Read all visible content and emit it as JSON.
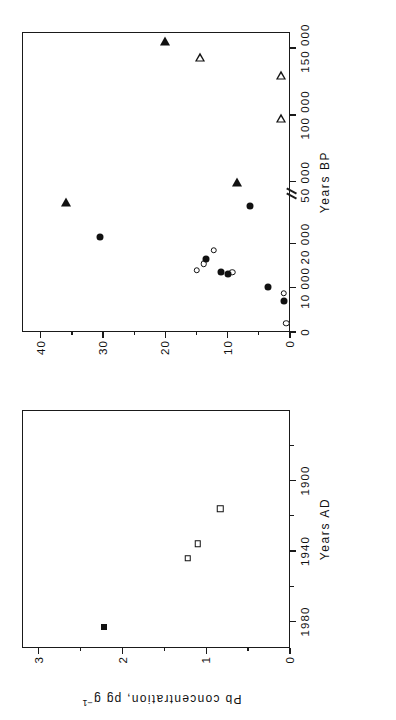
{
  "figure": {
    "y_axis_label": "Pb concentration, pg g",
    "y_axis_label_exp": "−1",
    "background": "#ffffff",
    "foreground": "#111111"
  },
  "panels": [
    {
      "id": "left",
      "x_axis_title": "Years AD",
      "x_ticks": [
        "1980",
        "1940",
        "1900"
      ],
      "x_tick_values": [
        1980,
        1940,
        1900
      ],
      "x_min": 1995,
      "x_max": 1860,
      "y_ticks": [
        "0",
        "1",
        "2",
        "3"
      ],
      "y_tick_values": [
        0,
        1,
        2,
        3
      ],
      "y_min": 0,
      "y_max": 3.2
    },
    {
      "id": "right",
      "x_axis_title": "Years BP",
      "x_ticks": [
        "0",
        "10 000",
        "20 000",
        "50 000",
        "100 000",
        "150 000"
      ],
      "x_tick_values": [
        0,
        10000,
        20000,
        50000,
        100000,
        150000
      ],
      "y_ticks": [
        "0",
        "10",
        "20",
        "30",
        "40"
      ],
      "y_tick_values": [
        0,
        10,
        20,
        30,
        40
      ],
      "y_min": 0,
      "y_max": 43,
      "axis_break": true,
      "axis_break_after": 30000
    }
  ],
  "chart_data": {
    "type": "scatter",
    "title": "",
    "xlabel": "Years AD / Years BP",
    "ylabel": "Pb concentration, pg g−1",
    "grid": false,
    "legend": "none",
    "panels": [
      {
        "name": "left",
        "xlabel": "Years AD",
        "ylabel": "Pb concentration, pg g−1",
        "xlim": [
          1995,
          1860
        ],
        "ylim": [
          0,
          3.2
        ],
        "xticks": [
          1980,
          1940,
          1900
        ],
        "yticks": [
          0,
          1,
          2,
          3
        ],
        "series": [
          {
            "name": "modern-snow-filled-square",
            "marker": "square-filled",
            "points": [
              {
                "x": 1983,
                "y": 2.22
              }
            ]
          },
          {
            "name": "historic-ice-open-square",
            "marker": "square-open",
            "points": [
              {
                "x": 1944,
                "y": 1.22
              },
              {
                "x": 1936,
                "y": 1.1
              },
              {
                "x": 1916,
                "y": 0.83
              }
            ]
          }
        ]
      },
      {
        "name": "right",
        "xlabel": "Years BP",
        "ylabel": "Pb concentration, pg g−1",
        "xticks": [
          0,
          10000,
          20000,
          50000,
          100000,
          150000
        ],
        "yticks": [
          0,
          10,
          20,
          30,
          40
        ],
        "ylim": [
          0,
          43
        ],
        "axis_break_between": [
          30000,
          45000
        ],
        "series": [
          {
            "name": "open-circles",
            "marker": "circle-open",
            "points": [
              {
                "x": 2000,
                "y": 0.6
              },
              {
                "x": 8800,
                "y": 1.0
              },
              {
                "x": 13500,
                "y": 9.3
              },
              {
                "x": 15500,
                "y": 13.8
              },
              {
                "x": 14000,
                "y": 15.0
              },
              {
                "x": 18500,
                "y": 12.2
              }
            ]
          },
          {
            "name": "filled-circles",
            "marker": "circle-filled",
            "points": [
              {
                "x": 7000,
                "y": 0.9
              },
              {
                "x": 10300,
                "y": 3.5
              },
              {
                "x": 13200,
                "y": 10.0
              },
              {
                "x": 13600,
                "y": 11.0
              },
              {
                "x": 16600,
                "y": 13.5
              },
              {
                "x": 21500,
                "y": 30.5
              },
              {
                "x": 28500,
                "y": 6.4
              }
            ]
          },
          {
            "name": "filled-triangles",
            "marker": "tri-filled",
            "points": [
              {
                "x": 50000,
                "y": 8.5
              },
              {
                "x": 35000,
                "y": 36.0
              },
              {
                "x": 155000,
                "y": 20.0
              }
            ]
          },
          {
            "name": "open-triangles",
            "marker": "tri-open",
            "points": [
              {
                "x": 98000,
                "y": 1.5
              },
              {
                "x": 130000,
                "y": 1.4
              },
              {
                "x": 143000,
                "y": 14.5
              }
            ]
          }
        ]
      }
    ]
  }
}
